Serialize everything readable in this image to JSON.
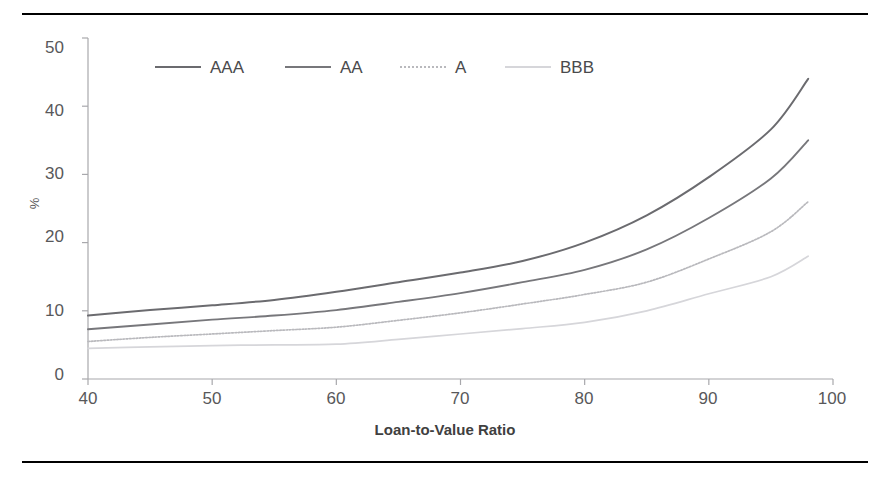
{
  "chart_data": {
    "type": "line",
    "title": "",
    "xlabel": "Loan-to-Value Ratio",
    "ylabel": "%",
    "xlim": [
      40,
      100
    ],
    "ylim": [
      0,
      50
    ],
    "xticks": [
      40,
      50,
      60,
      70,
      80,
      90,
      100
    ],
    "yticks": [
      0,
      10,
      20,
      30,
      40,
      50
    ],
    "grid": false,
    "legend_position": "top-center-inside",
    "x": [
      40,
      45,
      50,
      55,
      60,
      65,
      70,
      75,
      80,
      85,
      90,
      95,
      98
    ],
    "series": [
      {
        "name": "AAA",
        "color": "#6b6b6f",
        "style": "solid",
        "width": 2.0,
        "values": [
          9.3,
          10.1,
          10.8,
          11.6,
          12.8,
          14.2,
          15.6,
          17.3,
          20.0,
          24.0,
          29.6,
          36.6,
          44.0
        ]
      },
      {
        "name": "AA",
        "color": "#77777b",
        "style": "solid",
        "width": 1.9,
        "values": [
          7.3,
          8.0,
          8.7,
          9.3,
          10.1,
          11.3,
          12.6,
          14.2,
          16.0,
          19.0,
          23.6,
          29.4,
          35.0
        ]
      },
      {
        "name": "A",
        "color": "#b9b9bd",
        "style": "dotted",
        "width": 1.7,
        "values": [
          5.5,
          6.1,
          6.6,
          7.1,
          7.6,
          8.6,
          9.7,
          11.0,
          12.4,
          14.2,
          17.6,
          21.6,
          26.0
        ]
      },
      {
        "name": "BBB",
        "color": "#d6d6da",
        "style": "solid",
        "width": 1.7,
        "values": [
          4.5,
          4.7,
          4.9,
          5.0,
          5.1,
          5.8,
          6.6,
          7.4,
          8.3,
          10.0,
          12.5,
          15.0,
          18.0
        ]
      }
    ]
  },
  "axis": {
    "ytick_labels": [
      "50",
      "40",
      "30",
      "20",
      "10",
      "0"
    ],
    "xtick_labels": [
      "40",
      "50",
      "60",
      "70",
      "80",
      "90",
      "100"
    ],
    "y_axis_title": "%",
    "x_axis_title": "Loan-to-Value Ratio"
  },
  "legend": {
    "items": [
      {
        "label": "AAA"
      },
      {
        "label": "AA"
      },
      {
        "label": "A"
      },
      {
        "label": "BBB"
      }
    ]
  }
}
